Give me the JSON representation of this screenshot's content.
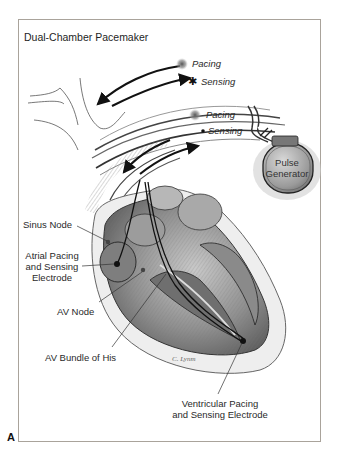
{
  "figure": {
    "title": "Dual-Chamber Pacemaker",
    "panel_letter": "A",
    "signature": "C. Lynm"
  },
  "legend": {
    "atrial": {
      "pacing": "Pacing",
      "sensing": "Sensing",
      "pacing_symbol": "glow-dot",
      "sensing_symbol": "asterisk"
    },
    "ventricular": {
      "pacing": "Pacing",
      "sensing": "Sensing",
      "pacing_symbol": "glow-dot",
      "sensing_symbol": "dot"
    }
  },
  "device": {
    "label_line1": "Pulse",
    "label_line2": "Generator"
  },
  "labels": {
    "sinus_node": "Sinus Node",
    "atrial_electrode_1": "Atrial Pacing",
    "atrial_electrode_2": "and Sensing",
    "atrial_electrode_3": "Electrode",
    "av_node": "AV Node",
    "bundle_of_his": "AV Bundle of His",
    "ventricular_electrode_1": "Ventricular Pacing",
    "ventricular_electrode_2": "and Sensing Electrode"
  },
  "colors": {
    "frame": "#a9a39b",
    "ink": "#222222",
    "shading": "#6e6e6e"
  }
}
